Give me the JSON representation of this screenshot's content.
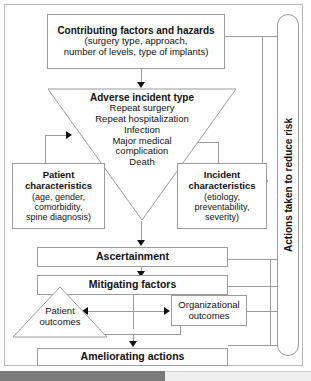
{
  "diagram": {
    "nodes": {
      "contributing": {
        "title": "Contributing factors and hazards",
        "detail_line1": "(surgery type, approach,",
        "detail_line2": "number of levels, type of implants)"
      },
      "adverse": {
        "title": "Adverse incident type",
        "items": [
          "Repeat surgery",
          "Repeat hospitalization",
          "Infection",
          "Major medical",
          "complication",
          "Death"
        ]
      },
      "patient_characteristics": {
        "title_line1": "Patient",
        "title_line2": "characteristics",
        "detail_line1": "(age, gender,",
        "detail_line2": "comorbidity,",
        "detail_line3": "spine diagnosis)"
      },
      "incident_characteristics": {
        "title_line1": "Incident",
        "title_line2": "characteristics",
        "detail_line1": "(etiology,",
        "detail_line2": "preventability,",
        "detail_line3": "severity)"
      },
      "ascertainment": {
        "label": "Ascertainment"
      },
      "mitigating": {
        "label": "Mitigating factors"
      },
      "patient_outcomes": {
        "line1": "Patient",
        "line2": "outcomes"
      },
      "organizational_outcomes": {
        "line1": "Organizational",
        "line2": "outcomes"
      },
      "ameliorating": {
        "label": "Ameliorating actions"
      },
      "side_panel": {
        "label": "Actions taken to reduce risk"
      }
    },
    "colors": {
      "border": "#9b9b9b",
      "frame": "#b9b9b9",
      "text": "#111111",
      "arrow": "#111111",
      "scrollbar_thumb": "#7a7a7a",
      "scrollbar_track": "#efefef",
      "background": "#ffffff"
    }
  }
}
